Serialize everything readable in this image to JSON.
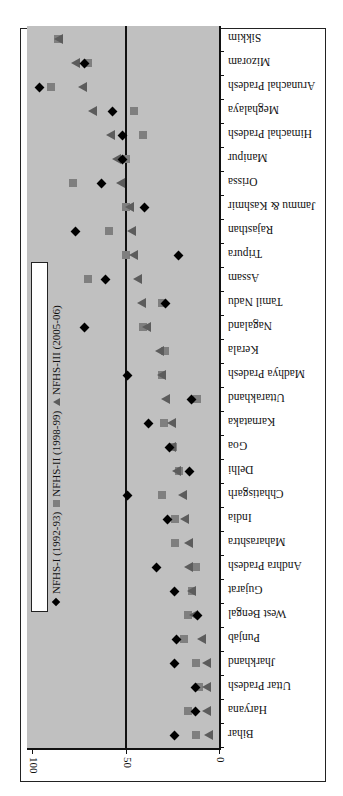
{
  "chart_data": {
    "type": "scatter",
    "orientation": "rotated-90-clockwise",
    "title": "",
    "xlabel": "",
    "ylabel": "",
    "ylim": [
      0,
      100
    ],
    "value_ticks": [
      "100",
      "50",
      "0"
    ],
    "reference_line": 50,
    "grid": false,
    "legend_position": "left-vertical",
    "categories": [
      "Bihar",
      "Haryana",
      "Uttar Pradesh",
      "Jharkhand",
      "Punjab",
      "West Bengal",
      "Gujarat",
      "Andhra Pradesh",
      "Maharashtra",
      "India",
      "Chhatisgarh",
      "Delhi",
      "Goa",
      "Karnataka",
      "Uttarakhand",
      "Madhya Pradesh",
      "Kerala",
      "Nagaland",
      "Tamil Nadu",
      "Assam",
      "Tripura",
      "Rajasthan",
      "Jammu & Kashmir",
      "Orissa",
      "Manipur",
      "Himachal Pradesh",
      "Meghalaya",
      "Arunachal Pradesh",
      "Mizoram",
      "Sikkim"
    ],
    "series": [
      {
        "name": "NFHS-I (1992-93)",
        "marker": "diamond",
        "color": "#000000",
        "values": [
          24,
          13,
          13,
          24,
          23,
          12,
          24,
          34,
          null,
          28,
          49,
          16,
          27,
          38,
          15,
          49,
          null,
          72,
          29,
          61,
          22,
          77,
          40,
          63,
          52,
          52,
          57,
          96,
          72,
          null
        ]
      },
      {
        "name": "NFHS-II (1998-99)",
        "marker": "square",
        "color": "#7f7f7f",
        "values": [
          13,
          17,
          11,
          13,
          19,
          17,
          15,
          13,
          24,
          24,
          31,
          22,
          25,
          30,
          12,
          31,
          29,
          41,
          31,
          70,
          50,
          59,
          50,
          78,
          50,
          41,
          46,
          90,
          70,
          86
        ]
      },
      {
        "name": "NFHS-III (2005-06)",
        "marker": "triangle",
        "color": "#5c5c5c",
        "values": [
          6,
          7,
          7,
          7,
          10,
          14,
          15,
          17,
          17,
          19,
          20,
          23,
          26,
          26,
          29,
          31,
          32,
          39,
          42,
          44,
          46,
          47,
          48,
          53,
          55,
          58,
          68,
          73,
          77,
          86
        ]
      }
    ]
  },
  "axis": {
    "tick_100": "100",
    "tick_50": "50",
    "tick_0": "0"
  },
  "legend": {
    "items": [
      {
        "label": "NFHS-I (1992-93)"
      },
      {
        "label": "NFHS-II (1998-99)"
      },
      {
        "label": "NFHS-III (2005-06)"
      }
    ]
  }
}
